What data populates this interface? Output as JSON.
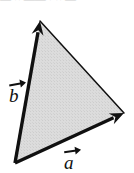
{
  "figure": {
    "name": "vector-triangle-diagram",
    "width": 134,
    "height": 173,
    "background_color": "#ffffff",
    "fill_color": "#d9d9d9",
    "stroke_color": "#101010"
  },
  "labels": {
    "vector_a": "a",
    "vector_b": "b"
  },
  "artifacts": {
    "top_cutoff_text": "—  ··  ——   ·   ··  —"
  },
  "chart_data": {
    "type": "diagram",
    "title": "",
    "xlabel": "",
    "ylabel": "",
    "shape": "triangle",
    "fill": "#d9d9d9",
    "stroke": "#101010",
    "vertices": [
      {
        "name": "origin",
        "x": 15,
        "y": 163
      },
      {
        "name": "b-tip",
        "x": 40,
        "y": 21
      },
      {
        "name": "a-tip",
        "x": 124,
        "y": 113
      }
    ],
    "vectors": [
      {
        "name": "b",
        "label": "b",
        "from": [
          15,
          163
        ],
        "to": [
          40,
          21
        ],
        "stroke_width": 3.4,
        "arrowhead": true,
        "label_position": [
          18,
          88
        ]
      },
      {
        "name": "a",
        "label": "a",
        "from": [
          15,
          163
        ],
        "to": [
          124,
          113
        ],
        "stroke_width": 3.4,
        "arrowhead": true,
        "label_position": [
          73,
          155
        ]
      }
    ],
    "edges": [
      {
        "name": "hypotenuse",
        "from": [
          40,
          21
        ],
        "to": [
          124,
          113
        ],
        "stroke_width": 1.5,
        "arrowhead": false
      }
    ]
  }
}
